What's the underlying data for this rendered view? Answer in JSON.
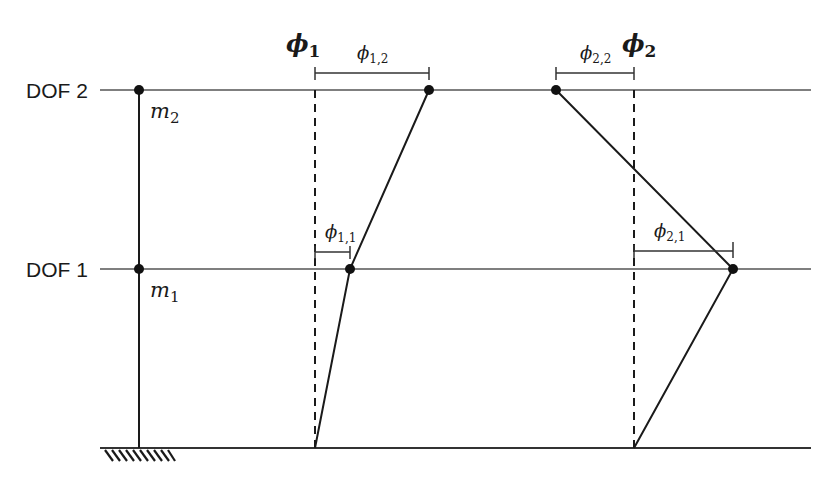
{
  "diagram": {
    "type": "two-degree-of-freedom shear building mode shapes",
    "floors": [
      {
        "label": "DOF 2",
        "mass": "m",
        "mass_sub": "2",
        "y": 90
      },
      {
        "label": "DOF 1",
        "mass": "m",
        "mass_sub": "1",
        "y": 269
      }
    ],
    "ground_y": 448,
    "modes": [
      {
        "name": "ϕ",
        "name_sub": "1",
        "ref_x": 315,
        "points": [
          [
            315,
            448
          ],
          [
            350,
            269
          ],
          [
            429,
            90
          ]
        ],
        "components": [
          {
            "label": "ϕ",
            "sub": "1,1",
            "from_x": 315,
            "to_x": 350,
            "y": 252
          },
          {
            "label": "ϕ",
            "sub": "1,2",
            "from_x": 315,
            "to_x": 429,
            "y": 73
          }
        ]
      },
      {
        "name": "ϕ",
        "name_sub": "2",
        "ref_x": 634,
        "points": [
          [
            634,
            448
          ],
          [
            733,
            269
          ],
          [
            556,
            90
          ]
        ],
        "components": [
          {
            "label": "ϕ",
            "sub": "2,1",
            "from_x": 634,
            "to_x": 733,
            "y": 252
          },
          {
            "label": "ϕ",
            "sub": "2,2",
            "from_x": 556,
            "to_x": 634,
            "y": 73
          }
        ]
      }
    ],
    "colors": {
      "line": "#1a1a1a",
      "floor_line": "#555555",
      "background": "#ffffff"
    }
  }
}
